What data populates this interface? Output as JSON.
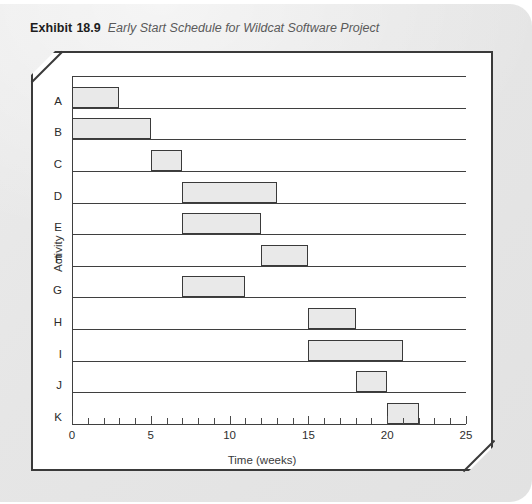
{
  "caption": {
    "label": "Exhibit",
    "number": "18.9",
    "title": "Early Start Schedule for Wildcat Software Project"
  },
  "chart_data": {
    "type": "bar",
    "orientation": "horizontal",
    "subtype": "gantt",
    "title": "Early Start Schedule for Wildcat Software Project",
    "xlabel": "Time (weeks)",
    "ylabel": "Activity",
    "xlim": [
      0,
      25
    ],
    "ylim": null,
    "grid": false,
    "legend": null,
    "xticks_major": [
      0,
      5,
      10,
      15,
      20,
      25
    ],
    "xtick_labels": [
      "0",
      "5",
      "10",
      "15",
      "20",
      "25"
    ],
    "xtick_minor_step": 1,
    "categories": [
      "A",
      "B",
      "C",
      "D",
      "E",
      "F",
      "G",
      "H",
      "I",
      "J",
      "K"
    ],
    "bars": [
      {
        "activity": "A",
        "start": 0,
        "finish": 3,
        "duration": 3
      },
      {
        "activity": "B",
        "start": 0,
        "finish": 5,
        "duration": 5
      },
      {
        "activity": "C",
        "start": 5,
        "finish": 7,
        "duration": 2
      },
      {
        "activity": "D",
        "start": 7,
        "finish": 13,
        "duration": 6
      },
      {
        "activity": "E",
        "start": 7,
        "finish": 12,
        "duration": 5
      },
      {
        "activity": "F",
        "start": 12,
        "finish": 15,
        "duration": 3
      },
      {
        "activity": "G",
        "start": 7,
        "finish": 11,
        "duration": 4
      },
      {
        "activity": "H",
        "start": 15,
        "finish": 18,
        "duration": 3
      },
      {
        "activity": "I",
        "start": 15,
        "finish": 21,
        "duration": 6
      },
      {
        "activity": "J",
        "start": 18,
        "finish": 20,
        "duration": 2
      },
      {
        "activity": "K",
        "start": 20,
        "finish": 22,
        "duration": 2
      }
    ],
    "colors": {
      "bar_fill": "#e9e9e9",
      "bar_border": "#3a3a3a",
      "axis": "#3f3f3f",
      "text": "#2a2a2a"
    }
  }
}
